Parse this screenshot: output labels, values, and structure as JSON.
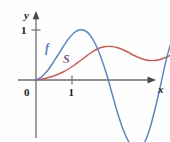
{
  "figure": {
    "background_color": "#fefefe",
    "axis_color": "#6e6e72",
    "text_color": "#232327",
    "width": 170,
    "height": 142
  },
  "axes": {
    "y_axis_label": "y",
    "x_axis_label": "x",
    "origin_label": "0",
    "y_tick_label": "1",
    "x_tick_label": "1",
    "y_tick_value": 1,
    "x_tick_value": 1
  },
  "labels": {
    "f_label": "f",
    "s_label": "S"
  },
  "chart_data": {
    "type": "line",
    "title": "",
    "subtitle": "",
    "xlabel": "x",
    "ylabel": "y",
    "xlim": [
      -0.35,
      4.6
    ],
    "ylim": [
      -1.45,
      1.3
    ],
    "grid": false,
    "legend": "inline-curve-labels",
    "xticks": [
      1
    ],
    "xticklabels": [
      "1"
    ],
    "yticks": [
      1
    ],
    "yticklabels": [
      "1"
    ],
    "origin_label": "0",
    "annotations": [
      {
        "text": "f",
        "x": 0.72,
        "y": 0.7,
        "color": "#5b7fb8"
      },
      {
        "text": "S",
        "x": 1.25,
        "y": 0.47,
        "color": "#7a5a86"
      }
    ],
    "series": [
      {
        "name": "f",
        "color": "#5b84bd",
        "description": "oscillating curve starting at origin, rising to 1, dipping far below axis, rising to 1 again, then falling",
        "x": [
          0.0,
          0.15,
          0.3,
          0.45,
          0.6,
          0.75,
          0.9,
          1.05,
          1.2,
          1.35,
          1.5,
          1.65,
          1.8,
          1.95,
          2.1,
          2.25,
          2.4,
          2.55,
          2.7,
          2.85,
          3.0,
          3.15,
          3.3,
          3.45,
          3.6,
          3.75,
          3.9,
          4.05,
          4.2,
          4.35,
          4.5
        ],
        "y": [
          0.0,
          0.06,
          0.17,
          0.32,
          0.49,
          0.66,
          0.82,
          0.94,
          1.0,
          0.99,
          0.9,
          0.72,
          0.46,
          0.14,
          -0.24,
          -0.62,
          -0.95,
          -1.2,
          -1.35,
          -1.38,
          -1.27,
          -1.0,
          -0.6,
          -0.14,
          0.35,
          0.74,
          0.97,
          1.0,
          0.78,
          0.24,
          -0.55
        ]
      },
      {
        "name": "S",
        "color": "#c0605c",
        "description": "smooth accumulation curve from origin rising to about 0.66, slight dip to 0.40, then leveling near 0.58",
        "x": [
          0.0,
          0.15,
          0.3,
          0.45,
          0.6,
          0.75,
          0.9,
          1.05,
          1.2,
          1.35,
          1.5,
          1.65,
          1.8,
          1.95,
          2.1,
          2.25,
          2.4,
          2.55,
          2.7,
          2.85,
          3.0,
          3.15,
          3.3,
          3.45,
          3.6,
          3.75,
          3.9,
          4.05,
          4.2,
          4.35,
          4.5
        ],
        "y": [
          0.0,
          0.02,
          0.04,
          0.07,
          0.11,
          0.16,
          0.22,
          0.29,
          0.37,
          0.45,
          0.53,
          0.6,
          0.65,
          0.67,
          0.67,
          0.65,
          0.61,
          0.56,
          0.5,
          0.45,
          0.41,
          0.39,
          0.39,
          0.41,
          0.45,
          0.5,
          0.54,
          0.57,
          0.58,
          0.58,
          0.58
        ]
      }
    ]
  }
}
